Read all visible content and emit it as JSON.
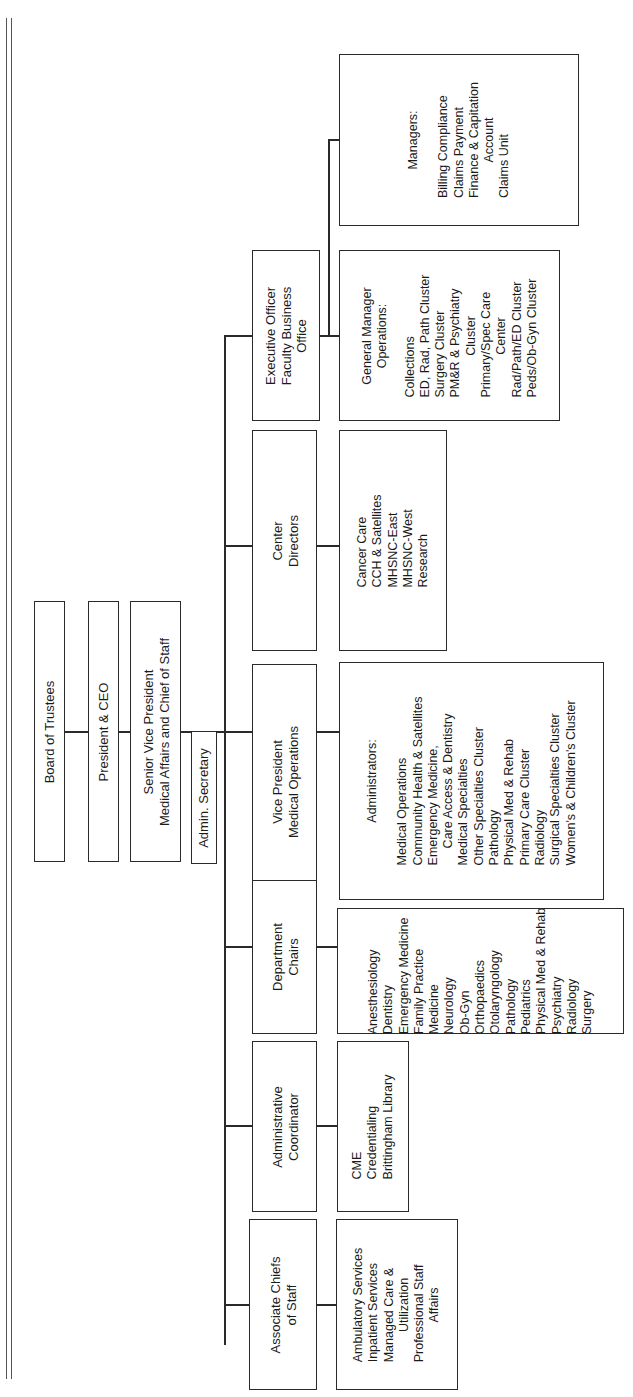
{
  "chart": {
    "executive": {
      "board": "Board of Trustees",
      "president": "President & CEO",
      "svp": [
        "Senior Vice President",
        "Medical Affairs and Chief of Staff"
      ],
      "admin_secretary": "Admin. Secretary"
    },
    "divisions": [
      {
        "id": "exec-officer",
        "title": [
          "Executive Officer",
          "Faculty Business",
          "Office"
        ],
        "subunits": [
          {
            "header": [
              "General Manager",
              "Operations:"
            ],
            "items": [
              "Collections",
              "ED, Rad, Path Cluster",
              "Surgery Cluster",
              "PM&R & Psychiatry",
              "   Cluster",
              "Primary/Spec Care",
              "   Center",
              "Rad/Path/ED Cluster",
              "Peds/Ob-Gyn Cluster"
            ]
          },
          {
            "header": [
              "Managers:"
            ],
            "items": [
              "Billing Compliance",
              "Claims Payment",
              "Finance & Capitation",
              "   Account",
              "Claims Unit"
            ]
          }
        ]
      },
      {
        "id": "center-directors",
        "title": [
          "Center",
          "Directors"
        ],
        "items": [
          "Cancer Care",
          "CCH & Satellites",
          "MHSNC-East",
          "MHSNC-West",
          "Research"
        ]
      },
      {
        "id": "vp-medical-ops",
        "title": [
          "Vice President",
          "Medical Operations"
        ],
        "header": [
          "Administrators:"
        ],
        "items": [
          "Medical Operations",
          "Community Health & Satellites",
          "Emergency Medicine,",
          "   Care Access & Dentistry",
          "Medical Specialties",
          "Other Specialties Cluster",
          "Pathology",
          "Physical Med & Rehab",
          "Primary Care Cluster",
          "Radiology",
          "Surgical Specialties Cluster",
          "Women's & Children's Cluster"
        ]
      },
      {
        "id": "department-chairs",
        "title": [
          "Department",
          "Chairs"
        ],
        "items": [
          "Anesthesiology",
          "Dentistry",
          "Emergency Medicine",
          "Family Practice",
          "Medicine",
          "Neurology",
          "Ob-Gyn",
          "Orthopaedics",
          "Otolaryngology",
          "Pathology",
          "Pediatrics",
          "Physical Med & Rehab",
          "Psychiatry",
          "Radiology",
          "Surgery"
        ]
      },
      {
        "id": "admin-coordinator",
        "title": [
          "Administrative",
          "Coordinator"
        ],
        "items": [
          "CME",
          "Credentialing",
          "Brittingham Library"
        ]
      },
      {
        "id": "associate-chiefs",
        "title": [
          "Associate Chiefs",
          "of Staff"
        ],
        "items": [
          "Ambulatory Services",
          "Inpatient Services",
          "Managed Care &",
          "   Utilization",
          "Professional Staff",
          "   Affairs"
        ]
      }
    ]
  },
  "lines": {
    "color": "#2a2a2a"
  }
}
